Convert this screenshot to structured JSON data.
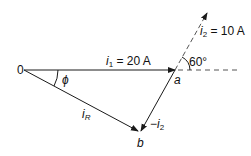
{
  "diagram": {
    "origin_label": "0",
    "point_a_label": "a",
    "point_b_label": "b",
    "i1": {
      "symbol": "i",
      "sub": "1",
      "value": " = 20 A"
    },
    "i2": {
      "symbol": "i",
      "sub": "2",
      "value": " = 10 A"
    },
    "iR": {
      "symbol": "i",
      "sub": "R"
    },
    "neg_i2": {
      "prefix": "−",
      "symbol": "i",
      "sub": "2"
    },
    "angle_60": "60°",
    "angle_phi": "ϕ",
    "colors": {
      "line": "#1a1a1a",
      "dashed": "#555555"
    }
  }
}
